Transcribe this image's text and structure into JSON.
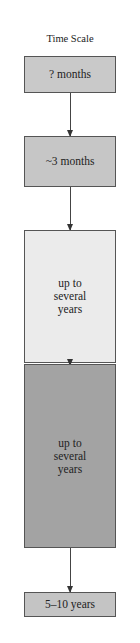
{
  "title": "Time Scale",
  "stages": [
    {
      "label": "? months",
      "fill": "#c9c9c9"
    },
    {
      "label": "~3 months",
      "fill": "#c6c6c6"
    },
    {
      "label": "up to\nseveral\nyears",
      "fill": "#ebebeb"
    },
    {
      "label": "up to\nseveral\nyears",
      "fill": "#a3a3a3"
    },
    {
      "label": "5–10 years",
      "fill": "#c4c4c4"
    }
  ]
}
